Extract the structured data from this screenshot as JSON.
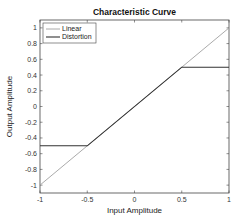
{
  "chart_data": {
    "type": "line",
    "title": "Characteristic Curve",
    "xlabel": "Input Amplitude",
    "ylabel": "Output Amplitude",
    "xlim": [
      -1,
      1
    ],
    "ylim": [
      -1.1,
      1.1
    ],
    "xticks": [
      -1,
      -0.5,
      0,
      0.5,
      1
    ],
    "xtick_labels": [
      "-1",
      "-0.5",
      "0",
      "0.5",
      "1"
    ],
    "yticks": [
      -1,
      -0.8,
      -0.6,
      -0.4,
      -0.2,
      0,
      0.2,
      0.4,
      0.6,
      0.8,
      1
    ],
    "ytick_labels": [
      "-1",
      "-0.8",
      "-0.6",
      "-0.4",
      "-0.2",
      "0",
      "0.2",
      "0.4",
      "0.6",
      "0.8",
      "1"
    ],
    "grid": false,
    "legend_position": "upper left",
    "series": [
      {
        "name": "Linear",
        "color": "#a0a0a0",
        "x": [
          -1,
          1
        ],
        "y": [
          -1,
          1
        ]
      },
      {
        "name": "Distortion",
        "color": "#333333",
        "x": [
          -1,
          -0.5,
          0.5,
          1
        ],
        "y": [
          -0.5,
          -0.5,
          0.5,
          0.5
        ]
      }
    ]
  }
}
